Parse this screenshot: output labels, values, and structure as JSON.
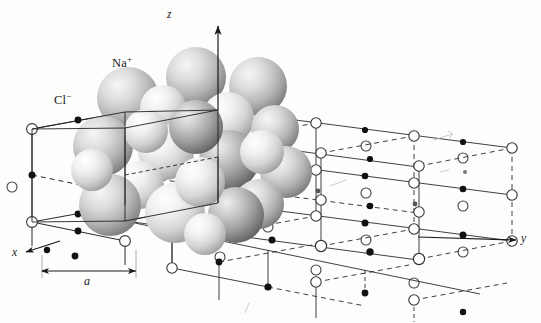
{
  "figure": {
    "background_color": "#fdfdfc",
    "width": 541,
    "height": 323
  },
  "labels": {
    "cation": "Na",
    "cation_charge": "+",
    "anion": "Cl",
    "anion_charge": "−",
    "axis_x": "x",
    "axis_y": "y",
    "axis_z": "z",
    "lattice_constant": "a"
  },
  "legend": {
    "cation_name": "sodium-ion-sphere",
    "anion_name": "chloride-ion-sphere",
    "cation_marker": "filled-dot",
    "anion_marker": "open-circle"
  },
  "colors": {
    "line": "#262626",
    "dashed_line": "#3a3a3a",
    "filled_dot": "#111111",
    "open_circle_stroke": "#333333",
    "sphere_dark_light": "#e2e2e2",
    "sphere_dark_mid": "#9a9a9a",
    "sphere_dark_deep": "#5a5a5a",
    "sphere_light_light": "#fbfbfb",
    "sphere_light_mid": "#d8d8d8",
    "sphere_light_deep": "#a6a6a6",
    "text": "#1a1a1a"
  },
  "geometry": {
    "origin": [
      218,
      110
    ],
    "axis_z_tip": [
      218,
      22
    ],
    "axis_y_tip": [
      512,
      241
    ],
    "axis_x_tip": [
      22,
      255
    ],
    "cell_edge_px": 93,
    "cells_along_y": 3
  },
  "annotations": {
    "dimension_line_label": "a",
    "dimension_from_x": 42,
    "dimension_to_x": 136,
    "dimension_y": 271
  }
}
